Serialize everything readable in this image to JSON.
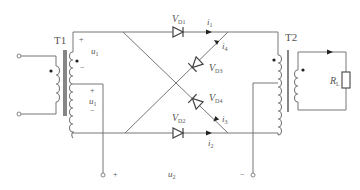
{
  "diagram": {
    "type": "circuit-schematic",
    "transformers": [
      {
        "id": "T1",
        "label": "T1"
      },
      {
        "id": "T2",
        "label": "T2"
      }
    ],
    "diodes": [
      {
        "id": "VD1",
        "sym": "V",
        "sub": "D1"
      },
      {
        "id": "VD2",
        "sym": "V",
        "sub": "D2"
      },
      {
        "id": "VD3",
        "sym": "V",
        "sub": "D3"
      },
      {
        "id": "VD4",
        "sym": "V",
        "sub": "D4"
      }
    ],
    "currents": [
      {
        "id": "i1",
        "sym": "i",
        "sub": "1"
      },
      {
        "id": "i2",
        "sym": "i",
        "sub": "2"
      },
      {
        "id": "i3",
        "sym": "i",
        "sub": "3"
      },
      {
        "id": "i4",
        "sym": "i",
        "sub": "4"
      }
    ],
    "voltages": {
      "u1_top": {
        "sym": "u",
        "sub": "1",
        "plus": "+",
        "minus": "−"
      },
      "u1_bottom": {
        "sym": "u",
        "sub": "1",
        "plus": "+",
        "minus": "−"
      },
      "u2": {
        "sym": "u",
        "sub": "2",
        "plus": "+",
        "minus": "−"
      }
    },
    "load": {
      "sym": "R",
      "sub": "L"
    },
    "colors": {
      "wire": "#777777",
      "component": "#444444",
      "text": "#555555"
    }
  }
}
